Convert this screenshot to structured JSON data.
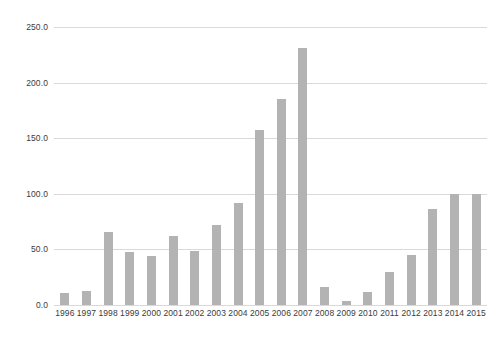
{
  "chart_data": {
    "type": "bar",
    "title": "",
    "subtitle": "",
    "xlabel": "",
    "ylabel": "",
    "ylim": [
      0,
      250
    ],
    "yticks": [
      0,
      50,
      100,
      150,
      200,
      250
    ],
    "ytick_labels": [
      "0.0",
      "50.0",
      "100.0",
      "150.0",
      "200.0",
      "250.0"
    ],
    "grid": true,
    "legend": false,
    "bar_color": "#b3b3b3",
    "gridline_color": "#d9d9d9",
    "text_color": "#3b3b3b",
    "background": "#ffffff",
    "categories": [
      "1996",
      "1997",
      "1998",
      "1999",
      "2000",
      "2001",
      "2002",
      "2003",
      "2004",
      "2005",
      "2006",
      "2007",
      "2008",
      "2009",
      "2010",
      "2011",
      "2012",
      "2013",
      "2014",
      "2015"
    ],
    "values": [
      11,
      13,
      66,
      48,
      44,
      62,
      49,
      72,
      92,
      157,
      185,
      231,
      16,
      4,
      12,
      30,
      45,
      86,
      100,
      100
    ]
  }
}
